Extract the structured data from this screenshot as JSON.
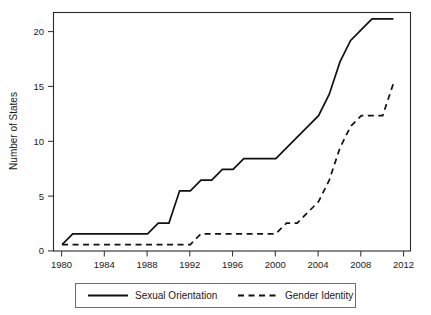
{
  "chart_data": {
    "type": "line",
    "title": "",
    "xlabel": "",
    "ylabel": "Number of States",
    "xlim": [
      1979.2,
      2012.6
    ],
    "ylim": [
      -0.6,
      21.6
    ],
    "xticks": [
      1980,
      1984,
      1988,
      1992,
      1996,
      2000,
      2004,
      2008,
      2012
    ],
    "yticks": [
      0,
      5,
      10,
      15,
      20
    ],
    "grid": false,
    "legend_position": "below-axes",
    "series": [
      {
        "name": "Sexual Orientation",
        "style": "solid",
        "color": "#111111",
        "x": [
          1980,
          1981,
          1982,
          1983,
          1984,
          1985,
          1986,
          1987,
          1988,
          1989,
          1990,
          1991,
          1992,
          1993,
          1994,
          1995,
          1996,
          1997,
          1998,
          1999,
          2000,
          2001,
          2002,
          2003,
          2004,
          2005,
          2006,
          2007,
          2008,
          2009,
          2010,
          2011
        ],
        "values": [
          0,
          1,
          1,
          1,
          1,
          1,
          1,
          1,
          1,
          2,
          2,
          5,
          5,
          6,
          6,
          7,
          7,
          8,
          8,
          8,
          8,
          9,
          10,
          11,
          12,
          14,
          17,
          19,
          20,
          21,
          21,
          21
        ]
      },
      {
        "name": "Gender Identity",
        "style": "dashed",
        "color": "#111111",
        "x": [
          1980,
          1981,
          1982,
          1983,
          1984,
          1985,
          1986,
          1987,
          1988,
          1989,
          1990,
          1991,
          1992,
          1993,
          1994,
          1995,
          1996,
          1997,
          1998,
          1999,
          2000,
          2001,
          2002,
          2003,
          2004,
          2005,
          2006,
          2007,
          2008,
          2009,
          2010,
          2011
        ],
        "values": [
          0,
          0,
          0,
          0,
          0,
          0,
          0,
          0,
          0,
          0,
          0,
          0,
          0,
          1,
          1,
          1,
          1,
          1,
          1,
          1,
          1,
          2,
          2,
          3,
          4,
          6,
          9,
          11,
          12,
          12,
          12,
          15
        ]
      }
    ]
  },
  "legend": {
    "entries": [
      {
        "label": "Sexual Orientation",
        "style": "solid"
      },
      {
        "label": "Gender Identity",
        "style": "dashed"
      }
    ]
  },
  "axes": {
    "y_title": "Number of States",
    "y_tick_labels": [
      "0",
      "5",
      "10",
      "15",
      "20"
    ],
    "x_tick_labels": [
      "1980",
      "1984",
      "1988",
      "1992",
      "1996",
      "2000",
      "2004",
      "2008",
      "2012"
    ]
  }
}
